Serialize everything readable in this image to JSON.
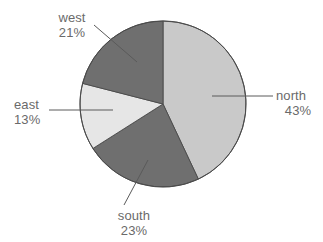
{
  "chart_data": {
    "type": "pie",
    "title": "",
    "labels": [
      "north",
      "south",
      "east",
      "west"
    ],
    "values": [
      43,
      23,
      13,
      21
    ],
    "value_suffix": "%",
    "slices": [
      {
        "name": "north",
        "label": "north",
        "value": 43,
        "value_text": "43%",
        "color": "#c9c9c9",
        "start_angle": 0,
        "end_angle": 154.8,
        "leader": "horizontal-right"
      },
      {
        "name": "south",
        "label": "south",
        "value": 23,
        "value_text": "23%",
        "color": "#6f6f6f",
        "start_angle": 154.8,
        "end_angle": 237.6,
        "leader": "diagonal-down-left"
      },
      {
        "name": "east",
        "label": "east",
        "value": 13,
        "value_text": "13%",
        "color": "#e6e6e6",
        "start_angle": 237.6,
        "end_angle": 284.4,
        "leader": "horizontal-left"
      },
      {
        "name": "west",
        "label": "west",
        "value": 21,
        "value_text": "21%",
        "color": "#6f6f6f",
        "start_angle": 284.4,
        "end_angle": 360,
        "leader": "diagonal-up-left"
      }
    ],
    "legend": "none",
    "grid": false,
    "background_color": "#ffffff",
    "text_color": "#6a6a6a",
    "outline_color": "#4a4a4a",
    "leader_line_color": "#5a5a5a",
    "geometry": {
      "center_x": 163,
      "center_y": 104,
      "radius": 83
    }
  }
}
